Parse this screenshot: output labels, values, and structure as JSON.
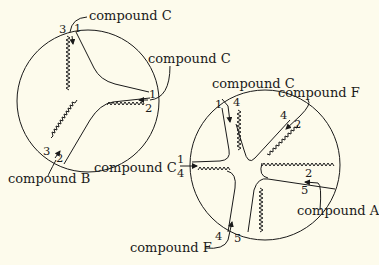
{
  "diagram": {
    "background": "#fdfbec",
    "ink": "#1a1a1a",
    "left_device": {
      "labels": {
        "top": "compound C",
        "right": "compound C",
        "bottom": "compound B"
      },
      "port_numbers": {
        "top_left": "3",
        "top_right": "1",
        "right_top": "1",
        "right_bottom": "2",
        "bottom_left": "3",
        "bottom_right": "2"
      }
    },
    "right_device": {
      "labels": {
        "top": "compound C",
        "top_right": "compound F",
        "left": "compound C",
        "right": "compound A",
        "bottom": "compound F"
      },
      "port_numbers": {
        "top_left": "1",
        "top_right": "4",
        "upper_right_left": "4",
        "upper_right_right": "2",
        "right_top": "2",
        "right_bottom": "5",
        "left_top": "1",
        "left_bottom": "4",
        "bottom_left": "4",
        "bottom_right": "5"
      }
    }
  }
}
